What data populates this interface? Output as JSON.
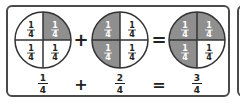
{
  "colors": {
    "shaded": "#8f8f8f",
    "unshaded": "#ffffff",
    "line": "#333333",
    "text_dark": "#222222",
    "text_light": "#ffffff"
  },
  "equation": {
    "terms": [
      {
        "label": "1/4",
        "numerator": "1",
        "denominator": "4",
        "shaded_quarters": [
          "top-right"
        ]
      },
      {
        "label": "2/4",
        "numerator": "2",
        "denominator": "4",
        "shaded_quarters": [
          "top-left",
          "bottom-left"
        ]
      },
      {
        "label": "3/4",
        "numerator": "3",
        "denominator": "4",
        "shaded_quarters": [
          "top-left",
          "top-right",
          "bottom-left"
        ]
      }
    ],
    "operators": [
      "+",
      "="
    ],
    "segment_label": {
      "numerator": "1",
      "denominator": "4"
    }
  },
  "bottom_row": {
    "f1": {
      "numerator": "1",
      "denominator": "4"
    },
    "op1": "+",
    "f2": {
      "numerator": "2",
      "denominator": "4"
    },
    "op2": "=",
    "f3": {
      "numerator": "3",
      "denominator": "4"
    }
  }
}
